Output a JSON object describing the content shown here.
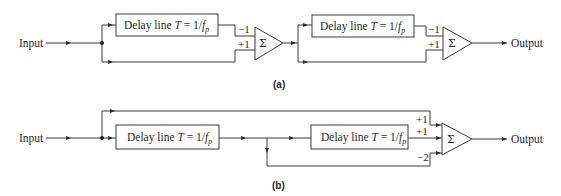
{
  "figure": {
    "a": {
      "caption": "(a)",
      "input_label": "Input",
      "output_label": "Output",
      "stages": [
        {
          "delay_box": {
            "prefix": "Delay line ",
            "var": "T",
            "eq": " = 1/",
            "f": "f",
            "sub": "p"
          },
          "summer": {
            "symbol": "Σ",
            "coef_top": "−1",
            "coef_bottom": "+1"
          }
        },
        {
          "delay_box": {
            "prefix": "Delay line ",
            "var": "T",
            "eq": " = 1/",
            "f": "f",
            "sub": "p"
          },
          "summer": {
            "symbol": "Σ",
            "coef_top": "−1",
            "coef_bottom": "+1"
          }
        }
      ]
    },
    "b": {
      "caption": "(b)",
      "input_label": "Input",
      "output_label": "Output",
      "delay_boxes": [
        {
          "prefix": "Delay line ",
          "var": "T",
          "eq": " = 1/",
          "f": "f",
          "sub": "p"
        },
        {
          "prefix": "Delay line ",
          "var": "T",
          "eq": " = 1/",
          "f": "f",
          "sub": "p"
        }
      ],
      "summer": {
        "symbol": "Σ",
        "coef_1": "+1",
        "coef_2": "+1",
        "coef_3": "−2"
      }
    }
  }
}
